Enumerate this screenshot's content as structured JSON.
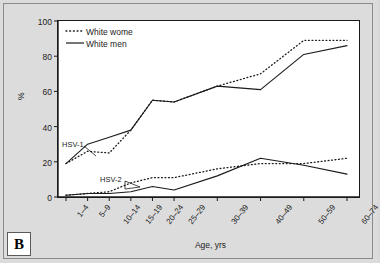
{
  "panel": {
    "label": "B"
  },
  "axes": {
    "ylabel": "%",
    "xlabel": "Age, yrs",
    "yticks": [
      "0",
      "20",
      "40",
      "60",
      "80",
      "100"
    ],
    "xticks": [
      "1–4",
      "5–9",
      "10–14",
      "15–19",
      "20–24",
      "25–29",
      "30–39",
      "40–49",
      "50–59",
      "60–74"
    ]
  },
  "legend": {
    "entries": [
      {
        "label": "White wome",
        "style": "dotted"
      },
      {
        "label": "White men",
        "style": "solid"
      }
    ]
  },
  "annotations": [
    {
      "name": "hsv1-annotation",
      "text": "HSV-1"
    },
    {
      "name": "hsv2-annotation",
      "text": "HSV-2"
    }
  ],
  "colors": {
    "line": "#1a1a1a",
    "plot_background": "#ffffff",
    "figure_background": "#dcdcdc",
    "axis": "#1a1a1a"
  },
  "chart_data": {
    "type": "line",
    "title": "",
    "xlabel": "Age, yrs",
    "ylabel": "%",
    "ylim": [
      0,
      100
    ],
    "yticks": [
      0,
      20,
      40,
      60,
      80,
      100
    ],
    "grid": false,
    "legend_position": "top-left",
    "categories": [
      "1–4",
      "5–9",
      "10–14",
      "15–19",
      "20–24",
      "25–29",
      "30–39",
      "40–49",
      "50–59",
      "60–74"
    ],
    "series": [
      {
        "name": "White wome",
        "group": "HSV-1",
        "style": "dotted",
        "values": [
          19,
          26,
          25,
          38,
          55,
          54,
          63,
          70,
          89,
          89
        ]
      },
      {
        "name": "White men",
        "group": "HSV-1",
        "style": "solid",
        "values": [
          19,
          30,
          34,
          38,
          55,
          54,
          63,
          61,
          81,
          86
        ]
      },
      {
        "name": "White wome",
        "group": "HSV-2",
        "style": "dotted",
        "values": [
          1,
          2,
          3,
          8,
          11,
          11,
          16,
          19,
          19,
          22
        ]
      },
      {
        "name": "White men",
        "group": "HSV-2",
        "style": "solid",
        "values": [
          1,
          2,
          2,
          3,
          6,
          4,
          12,
          22,
          18,
          13
        ]
      }
    ]
  }
}
